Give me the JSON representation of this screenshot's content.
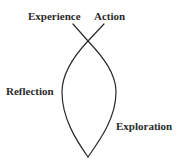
{
  "diagram": {
    "type": "cycle-loop",
    "labels": {
      "experience": "Experience",
      "action": "Action",
      "reflection": "Reflection",
      "exploration": "Exploration"
    },
    "colors": {
      "stroke": "#2a2a2a",
      "text": "#2a2a2a",
      "background": "#ffffff"
    }
  }
}
